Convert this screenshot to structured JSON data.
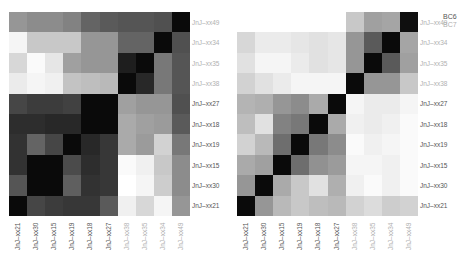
{
  "legend": {
    "items": [
      {
        "label": "BC6",
        "color": "#555555"
      },
      {
        "label": "BC7",
        "color": "#b0b0b0"
      }
    ]
  },
  "labels": {
    "rows": [
      "JnJ–xx49",
      "JnJ–xx34",
      "JnJ–xx35",
      "JnJ–xx38",
      "JnJ–xx27",
      "JnJ–xx18",
      "JnJ–xx19",
      "JnJ–xx15",
      "JnJ–xx30",
      "JnJ–xx21"
    ],
    "row_groups": [
      "BC7",
      "BC7",
      "BC7",
      "BC7",
      "BC6",
      "BC6",
      "BC6",
      "BC6",
      "BC6",
      "BC6"
    ],
    "cols": [
      "JnJ–xx21",
      "JnJ–xx30",
      "JnJ–xx15",
      "JnJ–xx19",
      "JnJ–xx18",
      "JnJ–xx27",
      "JnJ–xx38",
      "JnJ–xx35",
      "JnJ–xx34",
      "JnJ–xx49"
    ],
    "col_groups": [
      "BC6",
      "BC6",
      "BC6",
      "BC6",
      "BC6",
      "BC6",
      "BC7",
      "BC7",
      "BC7",
      "BC7"
    ]
  },
  "chart_data": [
    {
      "type": "heatmap",
      "title": "",
      "colormap": "grayscale (0=black, 255=white)",
      "rows": [
        "JnJ–xx49",
        "JnJ–xx34",
        "JnJ–xx35",
        "JnJ–xx38",
        "JnJ–xx27",
        "JnJ–xx18",
        "JnJ–xx19",
        "JnJ–xx15",
        "JnJ–xx30",
        "JnJ–xx21"
      ],
      "cols": [
        "JnJ–xx21",
        "JnJ–xx30",
        "JnJ–xx15",
        "JnJ–xx19",
        "JnJ–xx18",
        "JnJ–xx27",
        "JnJ–xx38",
        "JnJ–xx35",
        "JnJ–xx34",
        "JnJ–xx49"
      ],
      "legend": [
        "BC6",
        "BC7"
      ],
      "values": [
        [
          150,
          140,
          140,
          130,
          100,
          90,
          85,
          85,
          80,
          10
        ],
        [
          245,
          200,
          200,
          200,
          150,
          150,
          100,
          100,
          10,
          80
        ],
        [
          215,
          250,
          230,
          160,
          150,
          150,
          30,
          10,
          120,
          85
        ],
        [
          235,
          245,
          240,
          195,
          190,
          185,
          10,
          40,
          120,
          85
        ],
        [
          70,
          60,
          60,
          65,
          10,
          10,
          160,
          150,
          150,
          80
        ],
        [
          45,
          45,
          40,
          40,
          10,
          10,
          170,
          160,
          155,
          90
        ],
        [
          50,
          100,
          70,
          10,
          40,
          55,
          170,
          155,
          210,
          120
        ],
        [
          50,
          10,
          10,
          75,
          45,
          55,
          250,
          240,
          200,
          140
        ],
        [
          85,
          10,
          10,
          95,
          50,
          55,
          255,
          245,
          205,
          140
        ],
        [
          10,
          70,
          60,
          55,
          55,
          90,
          240,
          215,
          245,
          150
        ]
      ]
    },
    {
      "type": "heatmap",
      "title": "",
      "colormap": "grayscale (0=black, 255=white)",
      "rows": [
        "JnJ–xx49",
        "JnJ–xx34",
        "JnJ–xx35",
        "JnJ–xx38",
        "JnJ–xx27",
        "JnJ–xx18",
        "JnJ–xx19",
        "JnJ–xx15",
        "JnJ–xx30",
        "JnJ–xx21"
      ],
      "cols": [
        "JnJ–xx21",
        "JnJ–xx30",
        "JnJ–xx15",
        "JnJ–xx19",
        "JnJ–xx18",
        "JnJ–xx27",
        "JnJ–xx38",
        "JnJ–xx35",
        "JnJ–xx34",
        "JnJ–xx49"
      ],
      "legend": [
        "BC6",
        "BC7"
      ],
      "values": [
        [
          255,
          255,
          255,
          255,
          255,
          255,
          200,
          160,
          165,
          15
        ],
        [
          215,
          235,
          235,
          230,
          225,
          230,
          150,
          90,
          10,
          165
        ],
        [
          225,
          245,
          245,
          235,
          225,
          230,
          150,
          10,
          90,
          160
        ],
        [
          210,
          225,
          235,
          245,
          245,
          245,
          10,
          150,
          150,
          200
        ],
        [
          180,
          175,
          150,
          140,
          170,
          10,
          245,
          235,
          235,
          245
        ],
        [
          190,
          225,
          130,
          120,
          10,
          170,
          240,
          235,
          240,
          250
        ],
        [
          210,
          185,
          110,
          10,
          120,
          140,
          250,
          240,
          245,
          250
        ],
        [
          170,
          160,
          10,
          110,
          145,
          155,
          245,
          245,
          240,
          250
        ],
        [
          150,
          10,
          170,
          200,
          225,
          175,
          240,
          250,
          240,
          250
        ],
        [
          10,
          150,
          185,
          200,
          190,
          185,
          210,
          220,
          205,
          210
        ]
      ]
    }
  ]
}
